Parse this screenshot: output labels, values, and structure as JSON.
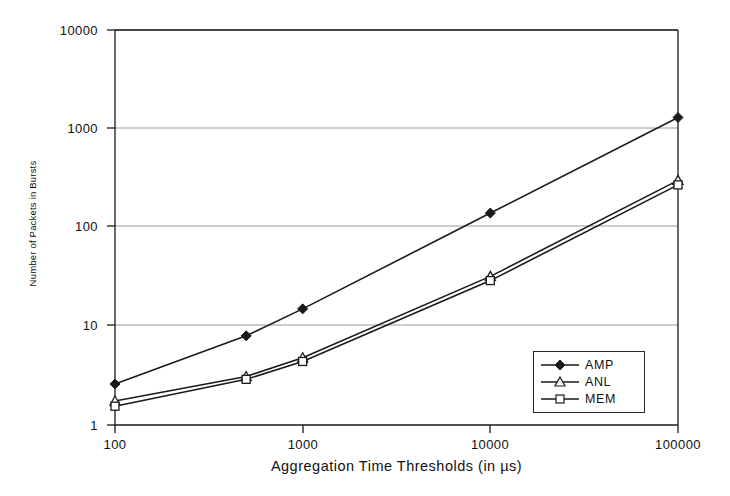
{
  "chart_data": {
    "type": "line",
    "title": "",
    "xlabel": "Aggregation Time Thresholds (in µs)",
    "ylabel": "Number of Packets in Bursts",
    "xscale": "log",
    "yscale": "log",
    "xlim": [
      100,
      100000
    ],
    "ylim": [
      1,
      10000
    ],
    "xticks": [
      "100",
      "1000",
      "10000",
      "100000"
    ],
    "yticks": [
      "1",
      "10",
      "100",
      "1000",
      "10000"
    ],
    "grid": "horizontal",
    "legend_position": "bottom-right",
    "x": [
      100,
      500,
      1000,
      10000,
      100000
    ],
    "series": [
      {
        "name": "AMP",
        "marker": "filled-diamond",
        "values": [
          2.6,
          8.0,
          15.0,
          140.0,
          1300.0
        ]
      },
      {
        "name": "ANL",
        "marker": "open-triangle",
        "values": [
          1.75,
          3.1,
          4.8,
          32.0,
          300.0
        ]
      },
      {
        "name": "MEM",
        "marker": "open-square",
        "values": [
          1.55,
          2.9,
          4.4,
          29.0,
          270.0
        ]
      }
    ],
    "colors": {
      "line": "#1a1a1a",
      "grid": "#999999",
      "axis": "#1a1a1a",
      "background": "#ffffff"
    }
  },
  "axes": {
    "y_labels": [
      "10000",
      "1000",
      "100",
      "10",
      "1"
    ],
    "x_labels": [
      "100",
      "1000",
      "10000",
      "100000"
    ],
    "x_title": "Aggregation Time Thresholds (in µs)",
    "y_title": "Number of Packets in Bursts"
  },
  "legend": {
    "items": [
      {
        "label": "AMP",
        "marker": "filled-diamond-icon"
      },
      {
        "label": "ANL",
        "marker": "open-triangle-icon"
      },
      {
        "label": "MEM",
        "marker": "open-square-icon"
      }
    ]
  }
}
